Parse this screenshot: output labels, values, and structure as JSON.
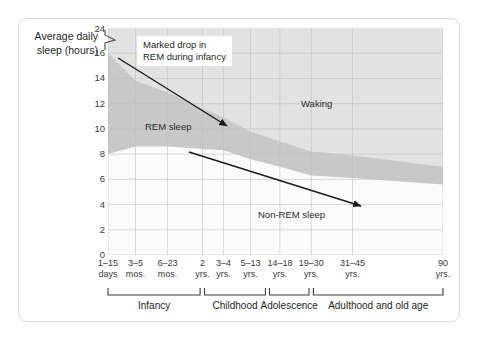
{
  "figure": {
    "y_axis_title": "Average daily sleep (hours)",
    "callout": {
      "line1": "Marked drop in",
      "line2": "REM during infancy"
    },
    "region_labels": {
      "waking": "Waking",
      "rem": "REM sleep",
      "non_rem": "Non-REM sleep"
    },
    "stage_labels": [
      "Infancy",
      "Childhood",
      "Adolescence",
      "Adulthood and old age"
    ],
    "colors": {
      "waking_fill": "#e2e2e2",
      "rem_fill": "#c8c8c8",
      "non_rem_fill": "#fbfbfb",
      "gridline": "#c0c0c0",
      "frame_border": "#dcdcdc",
      "text": "#231f20",
      "arrow": "#1a1a1a"
    }
  },
  "chart_data": {
    "type": "area",
    "title": "",
    "subtitle": "",
    "xlabel": "",
    "ylabel": "Average daily sleep (hours)",
    "ylim": [
      0,
      18
    ],
    "y_display_max_label": "24",
    "y_axis_break": true,
    "y_axis_break_note": "Axis is broken between 16 and 24 (zigzag mark just above the 16 tick)",
    "yticks": [
      0,
      2,
      4,
      6,
      8,
      10,
      12,
      14,
      16,
      24
    ],
    "ytick_labels": [
      "0",
      "2",
      "4",
      "6",
      "8",
      "10",
      "12",
      "14",
      "16",
      "24"
    ],
    "grid": true,
    "legend": "none",
    "categories": [
      "1–15 days",
      "3–5 mos.",
      "6–23 mos.",
      "2 yrs.",
      "3–4 yrs.",
      "5–13 yrs.",
      "14–18 yrs.",
      "19–30 yrs.",
      "31–45 yrs.",
      "90 yrs."
    ],
    "xtick_labels": [
      {
        "line1": "1–15",
        "line2": "days"
      },
      {
        "line1": "3–5",
        "line2": "mos."
      },
      {
        "line1": "6–23",
        "line2": "mos."
      },
      {
        "line1": "2",
        "line2": "yrs."
      },
      {
        "line1": "3–4",
        "line2": "yrs."
      },
      {
        "line1": "5–13",
        "line2": "yrs."
      },
      {
        "line1": "14–18",
        "line2": "yrs."
      },
      {
        "line1": "19–30",
        "line2": "yrs."
      },
      {
        "line1": "31–45",
        "line2": "yrs."
      },
      {
        "line1": "90",
        "line2": "yrs."
      }
    ],
    "series": [
      {
        "name": "Non-REM sleep",
        "note": "Hours of non-REM sleep per day (lower band, measured from 0)",
        "values": [
          8.0,
          8.6,
          8.6,
          8.4,
          8.3,
          7.6,
          7.0,
          6.3,
          6.1,
          5.6
        ]
      },
      {
        "name": "REM sleep",
        "note": "Hours of REM sleep per day (upper band, stacked on non-REM)",
        "values": [
          8.0,
          5.2,
          4.3,
          3.2,
          2.6,
          2.2,
          2.0,
          1.9,
          1.8,
          1.4
        ]
      },
      {
        "name": "Total sleep",
        "note": "Sum of REM + non-REM; remainder of the day is Waking",
        "values": [
          16.0,
          13.8,
          12.9,
          11.6,
          10.9,
          9.8,
          9.0,
          8.2,
          7.9,
          7.0
        ]
      }
    ],
    "annotations": [
      {
        "name": "rem-drop-arrow",
        "text": "Marked drop in REM during infancy",
        "points_from": "3–5 mos. near 16 h",
        "points_to": "6–23 mos. near 11.8 h"
      },
      {
        "name": "nonrem-decline-arrow",
        "text": "",
        "points_from": "2 yrs. near 8.3 h",
        "points_to": "31–45 yrs. near 4.6 h"
      }
    ],
    "stage_brackets": [
      {
        "label": "Infancy",
        "from": "1–15 days",
        "to": "2 yrs."
      },
      {
        "label": "Childhood",
        "from": "2 yrs.",
        "to": "13 yrs."
      },
      {
        "label": "Adolescence",
        "from": "14 yrs.",
        "to": "18 yrs."
      },
      {
        "label": "Adulthood and old age",
        "from": "19 yrs.",
        "to": "90 yrs."
      }
    ]
  }
}
